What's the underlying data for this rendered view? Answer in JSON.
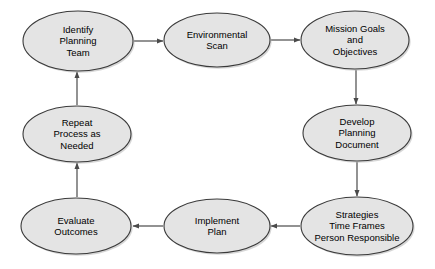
{
  "diagram": {
    "type": "cycle-flowchart",
    "colors": {
      "node_fill": "#e4e4e4",
      "node_stroke": "#3a3a3a",
      "node_shadow": "#b4b4b4",
      "connector": "#4a4a4a",
      "text": "#000000",
      "background": "#ffffff"
    },
    "nodes": [
      {
        "id": "identify-planning-team",
        "label": "Identify\nPlanning\nTeam",
        "lines": [
          "Identify",
          "Planning",
          "Team"
        ],
        "cx": 78,
        "cy": 41,
        "rx": 55,
        "ry": 30
      },
      {
        "id": "environmental-scan",
        "label": "Environmental\nScan",
        "lines": [
          "Environmental",
          "Scan"
        ],
        "cx": 217,
        "cy": 40,
        "rx": 53,
        "ry": 27
      },
      {
        "id": "mission-goals-and-objectives",
        "label": "Mission Goals\nand\nObjectives",
        "lines": [
          "Mission Goals",
          "and",
          "Objectives"
        ],
        "cx": 355,
        "cy": 40,
        "rx": 54,
        "ry": 29
      },
      {
        "id": "develop-planning-document",
        "label": "Develop\nPlanning\nDocument",
        "lines": [
          "Develop",
          "Planning",
          "Document"
        ],
        "cx": 357,
        "cy": 133,
        "rx": 54,
        "ry": 28
      },
      {
        "id": "strategies-time-frames-person-responsible",
        "label": "Strategies\nTime Frames\nPerson Responsible",
        "lines": [
          "Strategies",
          "Time Frames",
          "Person Responsible"
        ],
        "cx": 357,
        "cy": 226,
        "rx": 56,
        "ry": 29
      },
      {
        "id": "implement-plan",
        "label": "Implement\nPlan",
        "lines": [
          "Implement",
          "Plan"
        ],
        "cx": 217,
        "cy": 226,
        "rx": 53,
        "ry": 27
      },
      {
        "id": "evaluate-outcomes",
        "label": "Evaluate\nOutcomes",
        "lines": [
          "Evaluate",
          "Outcomes"
        ],
        "cx": 76,
        "cy": 226,
        "rx": 55,
        "ry": 28
      },
      {
        "id": "repeat-process-as-needed",
        "label": "Repeat\nProcess as\nNeeded",
        "lines": [
          "Repeat",
          "Process as",
          "Needed"
        ],
        "cx": 77,
        "cy": 134,
        "rx": 54,
        "ry": 28
      }
    ],
    "connectors": [
      {
        "id": "identify-to-environmental",
        "from": "identify-planning-team",
        "to": "environmental-scan",
        "direction": "right",
        "x1": 134,
        "y1": 41,
        "x2": 163,
        "y2": 41
      },
      {
        "id": "environmental-to-mission",
        "from": "environmental-scan",
        "to": "mission-goals-and-objectives",
        "direction": "right",
        "x1": 271,
        "y1": 40,
        "x2": 300,
        "y2": 40
      },
      {
        "id": "mission-to-develop",
        "from": "mission-goals-and-objectives",
        "to": "develop-planning-document",
        "direction": "down",
        "x1": 356,
        "y1": 70,
        "x2": 356,
        "y2": 104
      },
      {
        "id": "develop-to-strategies",
        "from": "develop-planning-document",
        "to": "strategies-time-frames-person-responsible",
        "direction": "down",
        "x1": 357,
        "y1": 162,
        "x2": 357,
        "y2": 196
      },
      {
        "id": "strategies-to-implement",
        "from": "strategies-time-frames-person-responsible",
        "to": "implement-plan",
        "direction": "left",
        "x1": 300,
        "y1": 226,
        "x2": 271,
        "y2": 226
      },
      {
        "id": "implement-to-evaluate",
        "from": "implement-plan",
        "to": "evaluate-outcomes",
        "direction": "left",
        "x1": 163,
        "y1": 226,
        "x2": 133,
        "y2": 226
      },
      {
        "id": "evaluate-to-repeat",
        "from": "evaluate-outcomes",
        "to": "repeat-process-as-needed",
        "direction": "up",
        "x1": 77,
        "y1": 197,
        "x2": 77,
        "y2": 163
      },
      {
        "id": "repeat-to-identify",
        "from": "repeat-process-as-needed",
        "to": "identify-planning-team",
        "direction": "up",
        "x1": 77,
        "y1": 105,
        "x2": 77,
        "y2": 72
      }
    ]
  }
}
